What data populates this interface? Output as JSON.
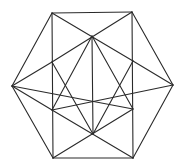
{
  "diagram": {
    "stroke_color": "#2a2a2a",
    "background": "#ffffff",
    "vertices": {
      "TL": [
        52,
        13
      ],
      "TR": [
        132,
        12
      ],
      "L": [
        12,
        86
      ],
      "R": [
        173,
        85
      ],
      "BL": [
        53,
        158
      ],
      "BR": [
        133,
        158
      ],
      "CT": [
        92,
        36
      ],
      "CB": [
        93,
        134
      ],
      "IL1": [
        52,
        62
      ],
      "IR1": [
        133,
        61
      ],
      "C": [
        92,
        86
      ],
      "IL2": [
        52,
        110
      ],
      "IR2": [
        133,
        109
      ]
    },
    "edges": [
      [
        "TL",
        "TR"
      ],
      [
        "TR",
        "R"
      ],
      [
        "R",
        "BR"
      ],
      [
        "BR",
        "BL"
      ],
      [
        "BL",
        "L"
      ],
      [
        "L",
        "TL"
      ],
      [
        "TL",
        "BL"
      ],
      [
        "TR",
        "BR"
      ],
      [
        "CT",
        "CB"
      ],
      [
        "TL",
        "IR1"
      ],
      [
        "IR1",
        "R"
      ],
      [
        "TR",
        "IL1"
      ],
      [
        "IL1",
        "L"
      ],
      [
        "L",
        "IR2"
      ],
      [
        "R",
        "IL2"
      ],
      [
        "IL1",
        "CB"
      ],
      [
        "IR1",
        "CB"
      ],
      [
        "IL2",
        "CT"
      ],
      [
        "IR2",
        "CT"
      ],
      [
        "IL2",
        "BR"
      ],
      [
        "IR2",
        "BL"
      ],
      [
        "L",
        "IL2"
      ]
    ]
  }
}
